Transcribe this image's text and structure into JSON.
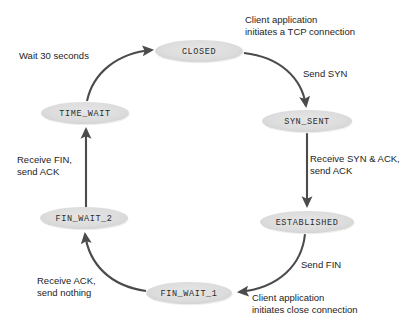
{
  "diagram": {
    "type": "state-machine",
    "background_color": "#ffffff",
    "node_fill_color": "#dcdcdc",
    "edge_color": "#4b4b4b",
    "text_color": "#1d1d1d",
    "states": [
      {
        "id": "closed",
        "label": "CLOSED",
        "cx": 199,
        "cy": 51,
        "rx": 44,
        "ry": 11
      },
      {
        "id": "syn_sent",
        "label": "SYN_SENT",
        "cx": 307,
        "cy": 121,
        "rx": 45,
        "ry": 11
      },
      {
        "id": "established",
        "label": "ESTABLISHED",
        "cx": 307,
        "cy": 222,
        "rx": 47,
        "ry": 11
      },
      {
        "id": "fin_wait_1",
        "label": "FIN_WAIT_1",
        "cx": 189,
        "cy": 293,
        "rx": 43,
        "ry": 11
      },
      {
        "id": "fin_wait_2",
        "label": "FIN_WAIT_2",
        "cx": 84,
        "cy": 218,
        "rx": 44,
        "ry": 11
      },
      {
        "id": "time_wait",
        "label": "TIME_WAIT",
        "cx": 85,
        "cy": 113,
        "rx": 44,
        "ry": 11
      }
    ],
    "transitions": [
      {
        "id": "closed-to-syn-sent",
        "from": "CLOSED",
        "to": "SYN_SENT",
        "labels": [
          "Client application",
          "initiates a TCP connection",
          "Send SYN"
        ]
      },
      {
        "id": "syn-sent-to-established",
        "from": "SYN_SENT",
        "to": "ESTABLISHED",
        "labels": [
          "Receive SYN & ACK,",
          "send ACK"
        ]
      },
      {
        "id": "established-to-fin-wait-1",
        "from": "ESTABLISHED",
        "to": "FIN_WAIT_1",
        "labels": [
          "Send FIN",
          "Client application",
          "initiates close connection"
        ]
      },
      {
        "id": "fin-wait-1-to-fin-wait-2",
        "from": "FIN_WAIT_1",
        "to": "FIN_WAIT_2",
        "labels": [
          "Receive ACK,",
          "send nothing"
        ]
      },
      {
        "id": "fin-wait-2-to-time-wait",
        "from": "FIN_WAIT_2",
        "to": "TIME_WAIT",
        "labels": [
          "Receive FIN,",
          "send ACK"
        ]
      },
      {
        "id": "time-wait-to-closed",
        "from": "TIME_WAIT",
        "to": "CLOSED",
        "labels": [
          "Wait 30 seconds"
        ]
      }
    ],
    "annotations": [
      {
        "id": "client-app-open-line1",
        "text": "Client application",
        "x": 245,
        "y": 16
      },
      {
        "id": "client-app-open-line2",
        "text": "initiates a TCP connection",
        "x": 245,
        "y": 28
      },
      {
        "id": "send-syn",
        "text": "Send SYN",
        "x": 303,
        "y": 70
      },
      {
        "id": "recv-syn-ack-line1",
        "text": "Receive SYN & ACK,",
        "x": 310,
        "y": 155
      },
      {
        "id": "recv-syn-ack-line2",
        "text": "send ACK",
        "x": 310,
        "y": 167
      },
      {
        "id": "send-fin",
        "text": "Send FIN",
        "x": 301,
        "y": 261
      },
      {
        "id": "client-app-close-line1",
        "text": "Client application",
        "x": 252,
        "y": 294
      },
      {
        "id": "client-app-close-line2",
        "text": "initiates close connection",
        "x": 252,
        "y": 306
      },
      {
        "id": "recv-ack-line1",
        "text": "Receive ACK,",
        "x": 37,
        "y": 277
      },
      {
        "id": "recv-ack-line2",
        "text": "send nothing",
        "x": 37,
        "y": 289
      },
      {
        "id": "recv-fin-line1",
        "text": "Receive FIN,",
        "x": 17,
        "y": 156
      },
      {
        "id": "recv-fin-line2",
        "text": "send ACK",
        "x": 17,
        "y": 168
      },
      {
        "id": "wait-30-seconds",
        "text": "Wait 30 seconds",
        "x": 19,
        "y": 52
      }
    ],
    "edge_paths": [
      {
        "id": "path-closed-syn-sent",
        "d": "M 244 53 C 280 57, 302 78, 306 106"
      },
      {
        "id": "path-syn-sent-established",
        "d": "M 307 133 L 307 206"
      },
      {
        "id": "path-established-fin-wait-1",
        "d": "M 305 234 C 302 264, 280 288, 239 292"
      },
      {
        "id": "path-fin-wait-1-fin-wait-2",
        "d": "M 146 291 C 110 286, 89 264, 85 234"
      },
      {
        "id": "path-fin-wait-2-time-wait",
        "d": "M 86 207 L 86 129"
      },
      {
        "id": "path-time-wait-closed",
        "d": "M 87 101 C 93 73, 117 53, 152 50"
      }
    ]
  }
}
